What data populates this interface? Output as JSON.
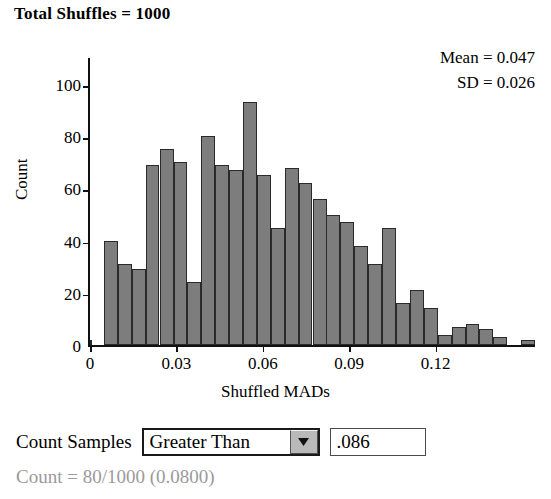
{
  "title": "Total Shuffles = 1000",
  "stats": {
    "mean": "Mean = 0.047",
    "sd": "SD = 0.026"
  },
  "controls": {
    "count_samples_label": "Count Samples",
    "comparison_selected": "Greater Than",
    "comparison_options": [
      "Greater Than",
      "Less Than",
      "Between",
      "Beyond"
    ],
    "dropdown_arrow_icon": "chevron-down-icon",
    "threshold_value": ".086",
    "threshold_placeholder": "",
    "count_result": "Count = 80/1000 (0.0800)"
  },
  "colors": {
    "bar_fill": "#7d7d7d",
    "bar_border": "#2a2a2a",
    "axis": "#111111",
    "result_text": "#9a9a9a"
  },
  "chart_data": {
    "type": "bar",
    "title": "Total Shuffles = 1000",
    "xlabel": "Shuffled MADs",
    "ylabel": "Count",
    "xlim": [
      0,
      0.1545
    ],
    "ylim": [
      0,
      110
    ],
    "xticks": [
      "0",
      "0.03",
      "0.06",
      "0.09",
      "0.12"
    ],
    "xtickvalues": [
      0,
      0.03,
      0.06,
      0.09,
      0.12
    ],
    "yticks": [
      "0",
      "20",
      "40",
      "60",
      "80",
      "100"
    ],
    "ytickvalues": [
      0,
      20,
      40,
      60,
      80,
      100
    ],
    "grid": false,
    "legend": null,
    "bin_width": 0.00483,
    "bin_starts": [
      0.0,
      0.0048,
      0.0097,
      0.0145,
      0.0193,
      0.0242,
      0.029,
      0.0338,
      0.0386,
      0.0435,
      0.0483,
      0.0531,
      0.058,
      0.0628,
      0.0676,
      0.0724,
      0.0773,
      0.0821,
      0.0869,
      0.0918,
      0.0966,
      0.1014,
      0.1062,
      0.1111,
      0.1159,
      0.1207,
      0.1256,
      0.1304,
      0.1352,
      0.14,
      0.1449,
      0.1497
    ],
    "values": [
      0,
      40,
      31,
      29,
      69,
      75,
      70,
      24,
      80,
      69,
      67,
      93,
      65,
      45,
      68,
      62,
      56,
      50,
      47,
      38,
      31,
      45,
      16,
      21,
      14,
      4,
      7,
      8,
      6,
      3,
      0,
      2,
      2
    ],
    "annotations": [
      "Mean = 0.047",
      "SD = 0.026"
    ]
  }
}
